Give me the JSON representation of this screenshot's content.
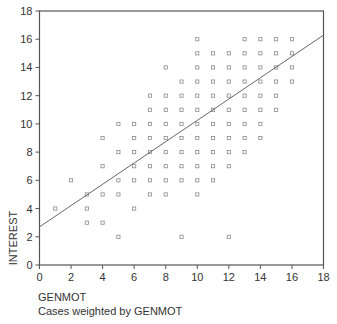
{
  "chart_data": {
    "type": "scatter",
    "title": "",
    "xlabel": "GENMOT",
    "ylabel": "INTEREST",
    "xlim": [
      0,
      18
    ],
    "ylim": [
      0,
      18
    ],
    "x_ticks": [
      0,
      2,
      4,
      6,
      8,
      10,
      12,
      14,
      16,
      18
    ],
    "y_ticks": [
      0,
      2,
      4,
      6,
      8,
      10,
      12,
      14,
      16,
      18
    ],
    "grid": false,
    "marker": "open-square",
    "points": [
      [
        1,
        4
      ],
      [
        2,
        6
      ],
      [
        3,
        5
      ],
      [
        3,
        4
      ],
      [
        3,
        3
      ],
      [
        4,
        9
      ],
      [
        4,
        7
      ],
      [
        4,
        5
      ],
      [
        4,
        3
      ],
      [
        5,
        10
      ],
      [
        5,
        8
      ],
      [
        5,
        6
      ],
      [
        5,
        5
      ],
      [
        5,
        2
      ],
      [
        6,
        10
      ],
      [
        6,
        9
      ],
      [
        6,
        8
      ],
      [
        6,
        7
      ],
      [
        6,
        6
      ],
      [
        6,
        4
      ],
      [
        7,
        12
      ],
      [
        7,
        11
      ],
      [
        7,
        10
      ],
      [
        7,
        9
      ],
      [
        7,
        8
      ],
      [
        7,
        7
      ],
      [
        7,
        6
      ],
      [
        7,
        5
      ],
      [
        8,
        14
      ],
      [
        8,
        12
      ],
      [
        8,
        11
      ],
      [
        8,
        10
      ],
      [
        8,
        9
      ],
      [
        8,
        8
      ],
      [
        8,
        7
      ],
      [
        8,
        6
      ],
      [
        8,
        5
      ],
      [
        9,
        13
      ],
      [
        9,
        12
      ],
      [
        9,
        11
      ],
      [
        9,
        10
      ],
      [
        9,
        9
      ],
      [
        9,
        8
      ],
      [
        9,
        7
      ],
      [
        9,
        6
      ],
      [
        9,
        2
      ],
      [
        10,
        16
      ],
      [
        10,
        15
      ],
      [
        10,
        14
      ],
      [
        10,
        13
      ],
      [
        10,
        12
      ],
      [
        10,
        11
      ],
      [
        10,
        10
      ],
      [
        10,
        9
      ],
      [
        10,
        8
      ],
      [
        10,
        7
      ],
      [
        10,
        6
      ],
      [
        10,
        5
      ],
      [
        11,
        15
      ],
      [
        11,
        14
      ],
      [
        11,
        13
      ],
      [
        11,
        12
      ],
      [
        11,
        11
      ],
      [
        11,
        10
      ],
      [
        11,
        9
      ],
      [
        11,
        8
      ],
      [
        11,
        7
      ],
      [
        11,
        6
      ],
      [
        12,
        15
      ],
      [
        12,
        14
      ],
      [
        12,
        13
      ],
      [
        12,
        12
      ],
      [
        12,
        11
      ],
      [
        12,
        10
      ],
      [
        12,
        9
      ],
      [
        12,
        8
      ],
      [
        12,
        7
      ],
      [
        12,
        2
      ],
      [
        13,
        16
      ],
      [
        13,
        15
      ],
      [
        13,
        14
      ],
      [
        13,
        13
      ],
      [
        13,
        12
      ],
      [
        13,
        11
      ],
      [
        13,
        10
      ],
      [
        13,
        9
      ],
      [
        13,
        8
      ],
      [
        14,
        16
      ],
      [
        14,
        15
      ],
      [
        14,
        14
      ],
      [
        14,
        13
      ],
      [
        14,
        12
      ],
      [
        14,
        11
      ],
      [
        14,
        10
      ],
      [
        14,
        9
      ],
      [
        15,
        16
      ],
      [
        15,
        15
      ],
      [
        15,
        14
      ],
      [
        15,
        13
      ],
      [
        15,
        12
      ],
      [
        15,
        11
      ],
      [
        16,
        16
      ],
      [
        16,
        15
      ],
      [
        16,
        14
      ],
      [
        16,
        13
      ]
    ],
    "fit_line": {
      "intercept": 2.7,
      "slope": 0.755
    },
    "footnote": "Cases weighted by GENMOT"
  },
  "colors": {
    "axis": "#555555",
    "marker": "#8a8a8a",
    "fit_line": "#666666",
    "text": "#333333"
  }
}
